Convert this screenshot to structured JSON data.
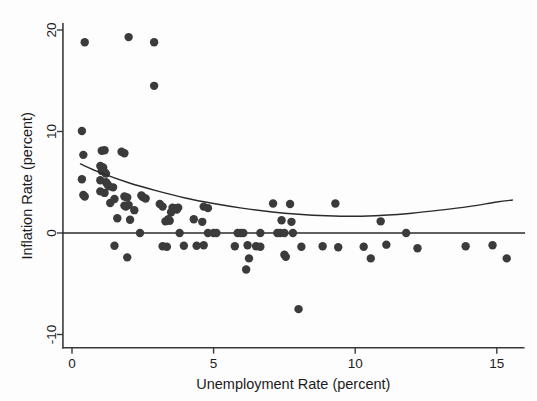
{
  "figure": {
    "background_color": "#fdfdfd",
    "point_color": "#3b3b3b",
    "line_color": "#2b2b2b",
    "axis_color": "#3a3a3a"
  },
  "axis_labels": {
    "x_title": "Unemployment Rate (percent)",
    "y_title": "Inflation Rate (percent)"
  },
  "ticks": {
    "x": [
      "0",
      "5",
      "10",
      "15"
    ],
    "y": [
      "20",
      "10",
      "0",
      "-10"
    ]
  },
  "chart_data": {
    "type": "scatter",
    "title": "",
    "xlabel": "Unemployment Rate (percent)",
    "ylabel": "Inflation Rate (percent)",
    "xlim": [
      -0.35,
      16.0
    ],
    "ylim": [
      -11.5,
      21.0
    ],
    "xticks": [
      0,
      5,
      10,
      15
    ],
    "yticks": [
      -10,
      0,
      10,
      20
    ],
    "grid": false,
    "legend": "none",
    "marker": "filled-circle",
    "marker_size_px": 4.2,
    "points": [
      [
        0.45,
        18.8
      ],
      [
        2.0,
        19.3
      ],
      [
        2.9,
        18.8
      ],
      [
        2.9,
        14.5
      ],
      [
        0.35,
        10.05
      ],
      [
        0.4,
        7.7
      ],
      [
        1.05,
        8.1
      ],
      [
        1.15,
        8.15
      ],
      [
        1.75,
        8.0
      ],
      [
        1.85,
        7.85
      ],
      [
        1.0,
        6.6
      ],
      [
        1.1,
        6.45
      ],
      [
        1.05,
        6.1
      ],
      [
        1.15,
        6.0
      ],
      [
        1.2,
        5.85
      ],
      [
        0.35,
        5.3
      ],
      [
        1.0,
        5.2
      ],
      [
        1.2,
        5.0
      ],
      [
        1.25,
        4.8
      ],
      [
        1.3,
        4.6
      ],
      [
        1.45,
        4.5
      ],
      [
        0.4,
        3.75
      ],
      [
        0.45,
        3.6
      ],
      [
        1.0,
        4.1
      ],
      [
        1.15,
        3.95
      ],
      [
        1.5,
        3.35
      ],
      [
        1.85,
        3.6
      ],
      [
        1.95,
        3.5
      ],
      [
        2.45,
        3.7
      ],
      [
        2.5,
        3.55
      ],
      [
        2.6,
        3.4
      ],
      [
        1.35,
        2.95
      ],
      [
        1.85,
        2.7
      ],
      [
        1.9,
        2.6
      ],
      [
        2.0,
        2.75
      ],
      [
        3.1,
        2.85
      ],
      [
        3.2,
        2.6
      ],
      [
        3.55,
        2.5
      ],
      [
        3.65,
        2.45
      ],
      [
        3.7,
        2.3
      ],
      [
        3.75,
        2.5
      ],
      [
        2.2,
        2.25
      ],
      [
        3.5,
        2.05
      ],
      [
        4.65,
        2.6
      ],
      [
        4.8,
        2.45
      ],
      [
        7.1,
        2.9
      ],
      [
        7.7,
        2.85
      ],
      [
        9.3,
        2.9
      ],
      [
        1.6,
        1.45
      ],
      [
        2.05,
        1.3
      ],
      [
        3.3,
        1.15
      ],
      [
        3.4,
        1.35
      ],
      [
        3.45,
        1.2
      ],
      [
        4.3,
        1.35
      ],
      [
        4.6,
        1.1
      ],
      [
        7.4,
        1.25
      ],
      [
        7.75,
        1.1
      ],
      [
        10.9,
        1.15
      ],
      [
        2.4,
        0.0
      ],
      [
        3.8,
        0.0
      ],
      [
        4.8,
        0.0
      ],
      [
        5.0,
        0.0
      ],
      [
        5.1,
        0.0
      ],
      [
        5.85,
        0.0
      ],
      [
        5.95,
        0.0
      ],
      [
        6.05,
        0.0
      ],
      [
        6.65,
        0.0
      ],
      [
        7.25,
        0.0
      ],
      [
        7.35,
        0.0
      ],
      [
        7.5,
        0.0
      ],
      [
        7.8,
        0.0
      ],
      [
        11.8,
        0.0
      ],
      [
        1.5,
        -1.25
      ],
      [
        3.2,
        -1.3
      ],
      [
        3.35,
        -1.35
      ],
      [
        3.95,
        -1.25
      ],
      [
        4.4,
        -1.25
      ],
      [
        4.65,
        -1.2
      ],
      [
        5.75,
        -1.3
      ],
      [
        6.2,
        -1.2
      ],
      [
        6.5,
        -1.3
      ],
      [
        6.65,
        -1.35
      ],
      [
        8.1,
        -1.35
      ],
      [
        8.85,
        -1.3
      ],
      [
        9.4,
        -1.4
      ],
      [
        10.3,
        -1.35
      ],
      [
        11.1,
        -1.15
      ],
      [
        12.2,
        -1.5
      ],
      [
        13.9,
        -1.3
      ],
      [
        14.85,
        -1.2
      ],
      [
        1.95,
        -2.4
      ],
      [
        6.25,
        -2.5
      ],
      [
        7.5,
        -2.15
      ],
      [
        7.55,
        -2.35
      ],
      [
        10.55,
        -2.5
      ],
      [
        15.35,
        -2.5
      ],
      [
        6.15,
        -3.6
      ],
      [
        8.0,
        -7.5
      ]
    ],
    "fit_curve": {
      "label": "quadratic fit",
      "x_start": 0.3,
      "x_end": 15.55,
      "points": [
        [
          0.3,
          6.8
        ],
        [
          1.0,
          5.95
        ],
        [
          2.0,
          4.95
        ],
        [
          3.0,
          4.15
        ],
        [
          4.0,
          3.45
        ],
        [
          5.0,
          2.9
        ],
        [
          6.0,
          2.45
        ],
        [
          7.0,
          2.1
        ],
        [
          8.0,
          1.85
        ],
        [
          9.0,
          1.7
        ],
        [
          10.0,
          1.65
        ],
        [
          11.0,
          1.75
        ],
        [
          12.0,
          1.95
        ],
        [
          13.0,
          2.25
        ],
        [
          14.0,
          2.6
        ],
        [
          15.0,
          3.05
        ],
        [
          15.55,
          3.25
        ]
      ]
    },
    "reference_line": {
      "label": "zero inflation line",
      "y": 0,
      "x_start": -0.35,
      "x_end": 16.0
    }
  }
}
